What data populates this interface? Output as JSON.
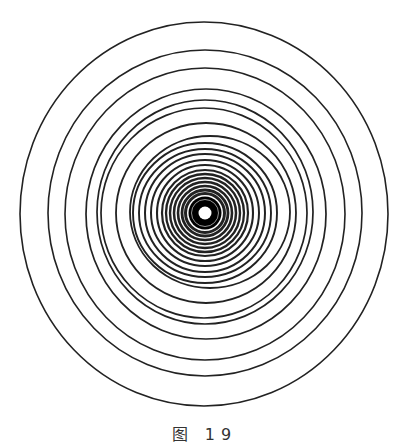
{
  "figure": {
    "stroke_color": "#222222",
    "core_color": "#000000",
    "center_dot_color": "#ffffff",
    "center": [
      205,
      213
    ],
    "rings": [
      {
        "cx": 204,
        "cy": 214,
        "rx": 184,
        "ry": 192,
        "w": 1.6
      },
      {
        "cx": 205,
        "cy": 213,
        "rx": 157,
        "ry": 163,
        "w": 1.6
      },
      {
        "cx": 205,
        "cy": 214,
        "rx": 140,
        "ry": 146,
        "w": 1.6
      },
      {
        "cx": 206,
        "cy": 214,
        "rx": 120,
        "ry": 125,
        "w": 1.7
      },
      {
        "cx": 205,
        "cy": 212,
        "rx": 108,
        "ry": 112,
        "w": 1.7
      },
      {
        "cx": 204,
        "cy": 213,
        "rx": 103,
        "ry": 105,
        "w": 1.7
      },
      {
        "cx": 206,
        "cy": 213,
        "rx": 90,
        "ry": 90,
        "w": 1.8
      },
      {
        "cx": 210,
        "cy": 212,
        "rx": 80,
        "ry": 76,
        "w": 1.8
      },
      {
        "cx": 205,
        "cy": 213,
        "rx": 72,
        "ry": 70,
        "w": 1.9
      },
      {
        "cx": 205,
        "cy": 213,
        "rx": 66,
        "ry": 64,
        "w": 1.9
      },
      {
        "cx": 205,
        "cy": 213,
        "rx": 60,
        "ry": 59,
        "w": 2
      },
      {
        "cx": 205,
        "cy": 213,
        "rx": 54,
        "ry": 53,
        "w": 2
      },
      {
        "cx": 205,
        "cy": 213,
        "rx": 48,
        "ry": 48,
        "w": 2.1
      },
      {
        "cx": 205,
        "cy": 213,
        "rx": 43,
        "ry": 43,
        "w": 2.2
      },
      {
        "cx": 205,
        "cy": 213,
        "rx": 39,
        "ry": 39,
        "w": 2.3
      },
      {
        "cx": 205,
        "cy": 213,
        "rx": 35,
        "ry": 35,
        "w": 2.4
      },
      {
        "cx": 205,
        "cy": 213,
        "rx": 31,
        "ry": 31,
        "w": 2.5
      },
      {
        "cx": 205,
        "cy": 213,
        "rx": 27,
        "ry": 27,
        "w": 2.6
      },
      {
        "cx": 205,
        "cy": 213,
        "rx": 23,
        "ry": 23,
        "w": 2.8
      },
      {
        "cx": 205,
        "cy": 213,
        "rx": 19.5,
        "ry": 19.5,
        "w": 3
      }
    ],
    "core": {
      "r": 16.5,
      "inner_white_ring_r": 13.5,
      "dot_r": 6.5
    }
  },
  "caption": {
    "text": "图 19"
  }
}
